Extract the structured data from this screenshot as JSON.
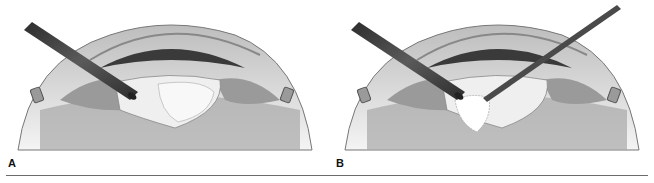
{
  "figure": {
    "panels": [
      {
        "label": "A",
        "description": "Cross-section of eye with a single instrument (phaco/irrigation probe) entering from upper-left and touching the lens nucleus"
      },
      {
        "label": "B",
        "description": "Cross-section of eye with instrument from upper-left plus a second thin instrument from upper-right fragmenting the lens nucleus"
      }
    ],
    "colors": {
      "background": "#ffffff",
      "sclera": "#d8d8d8",
      "iris_dark": "#3a3a3a",
      "lens": "#efefef",
      "vitreous": "#a8a8a8",
      "instrument": "#444444",
      "rule": "#6a6a6a"
    }
  }
}
